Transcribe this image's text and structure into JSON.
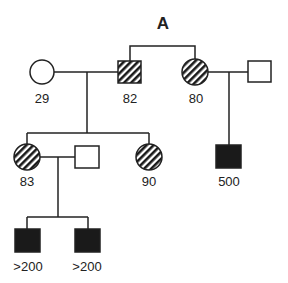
{
  "title": "A",
  "colors": {
    "line": "#222222",
    "affected": "#1a1a1a",
    "background": "#ffffff"
  },
  "legend": {
    "hatched": "partially affected / carrier",
    "filled": "affected",
    "open": "unaffected"
  },
  "individuals": [
    {
      "id": "I-1",
      "generation": 1,
      "sex": "female",
      "status": "unaffected",
      "label": "29"
    },
    {
      "id": "I-2",
      "generation": 1,
      "sex": "male",
      "status": "hatched",
      "label": "82"
    },
    {
      "id": "I-3",
      "generation": 1,
      "sex": "female",
      "status": "hatched",
      "label": "80"
    },
    {
      "id": "I-4",
      "generation": 1,
      "sex": "male",
      "status": "unaffected",
      "label": ""
    },
    {
      "id": "II-1",
      "generation": 2,
      "sex": "female",
      "status": "hatched",
      "label": "83"
    },
    {
      "id": "II-2",
      "generation": 2,
      "sex": "male",
      "status": "unaffected",
      "label": ""
    },
    {
      "id": "II-3",
      "generation": 2,
      "sex": "female",
      "status": "hatched",
      "label": "90"
    },
    {
      "id": "II-4",
      "generation": 2,
      "sex": "male",
      "status": "affected",
      "label": "500"
    },
    {
      "id": "III-1",
      "generation": 3,
      "sex": "male",
      "status": "affected",
      "label": ">200"
    },
    {
      "id": "III-2",
      "generation": 3,
      "sex": "male",
      "status": "affected",
      "label": ">200"
    }
  ],
  "relationships": [
    {
      "type": "siblings",
      "members": [
        "I-2",
        "I-3"
      ]
    },
    {
      "type": "couple",
      "members": [
        "I-1",
        "I-2"
      ],
      "children": [
        "II-1",
        "II-3"
      ]
    },
    {
      "type": "couple",
      "members": [
        "I-3",
        "I-4"
      ],
      "children": [
        "II-4"
      ]
    },
    {
      "type": "couple",
      "members": [
        "II-1",
        "II-2"
      ],
      "children": [
        "III-1",
        "III-2"
      ]
    }
  ]
}
